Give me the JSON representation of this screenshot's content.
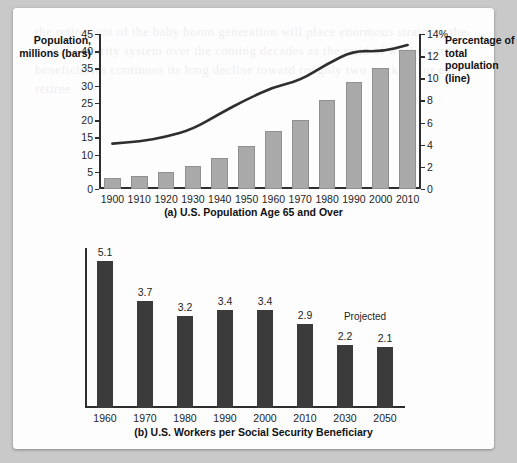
{
  "figure": {
    "background_color": "#c9c9c9",
    "page_color": "#fdfdfd",
    "ghost_text": "the retirement of the baby boom generation will place enormous strain on the Social Security system over the coming decades as the ratio of workers to beneficiaries continues its long decline toward roughly two workers for every retiree"
  },
  "chart_data": [
    {
      "type": "bar",
      "id": "chart-a",
      "title": "(a) U.S. Population Age 65 and Over",
      "xlabel": "",
      "ylabel": "Population, millions (bars)",
      "y2label": "Percentage of total population (line)",
      "categories": [
        "1900",
        "1910",
        "1920",
        "1930",
        "1940",
        "1950",
        "1960",
        "1970",
        "1980",
        "1990",
        "2000",
        "2010"
      ],
      "series": [
        {
          "name": "Population, millions (bars)",
          "kind": "bar",
          "axis": "left",
          "color": "#a9a9a9",
          "values": [
            3.1,
            3.9,
            4.9,
            6.6,
            9.0,
            12.4,
            16.7,
            20.1,
            25.7,
            31.2,
            35.0,
            40.3
          ]
        },
        {
          "name": "Percentage of total population (line)",
          "kind": "line",
          "axis": "right",
          "color": "#2e2e2e",
          "values": [
            4.1,
            4.3,
            4.7,
            5.4,
            6.8,
            8.1,
            9.2,
            9.8,
            11.3,
            12.5,
            12.4,
            13.0
          ]
        }
      ],
      "ylim": [
        0,
        45
      ],
      "yticks": [
        0,
        5,
        10,
        15,
        20,
        25,
        30,
        35,
        40,
        45
      ],
      "y2lim": [
        0,
        14
      ],
      "y2ticks": [
        0,
        2,
        4,
        6,
        8,
        10,
        12,
        14
      ],
      "y2_top_tick_label": "14%",
      "grid": false,
      "legend": "none"
    },
    {
      "type": "bar",
      "id": "chart-b",
      "title": "(b) U.S. Workers per Social Security Beneficiary",
      "xlabel": "",
      "ylabel": "",
      "categories": [
        "1960",
        "1970",
        "1980",
        "1990",
        "2000",
        "2010",
        "2030",
        "2050"
      ],
      "values": [
        5.1,
        3.7,
        3.2,
        3.4,
        3.4,
        2.9,
        2.2,
        2.1
      ],
      "value_labels": [
        "5.1",
        "3.7",
        "3.2",
        "3.4",
        "3.4",
        "2.9",
        "2.2",
        "2.1"
      ],
      "bar_color": "#3b3b3b",
      "ylim": [
        0,
        5.55
      ],
      "grid": false,
      "legend": "none",
      "annotations": [
        {
          "text": "Projected",
          "over_categories": [
            "2030",
            "2050"
          ]
        }
      ]
    }
  ]
}
